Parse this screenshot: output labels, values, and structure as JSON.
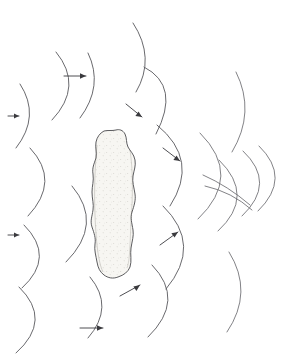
{
  "figure": {
    "title": "",
    "caption": "",
    "background_color": "#ffffff",
    "line_color": "#58585c",
    "arrow_color": "#3a3a3e",
    "obstacle_fill": "#f7f6f2",
    "obstacle_stroke": "#4a4a4d",
    "width_px": 300,
    "height_px": 363
  },
  "obstacle": {
    "name": "stippled-irregular-obstacle",
    "label": "",
    "style": "stipple",
    "center_x": 113,
    "center_y": 205,
    "approx_width_px": 50,
    "approx_height_px": 160
  },
  "incident_waves": {
    "group_label": "",
    "direction": "left-to-right",
    "arc_count": 9,
    "arcs": [
      {
        "id": "arc-tl-1",
        "cx": 60,
        "cy": 86,
        "r": 42,
        "a0": -52,
        "a1": 52
      },
      {
        "id": "arc-tl-2",
        "cx": -4,
        "cy": 115,
        "r": 42,
        "a0": -56,
        "a1": 56
      },
      {
        "id": "arc-tm-1",
        "cx": 100,
        "cy": 48,
        "r": 48,
        "a0": -52,
        "a1": 46
      },
      {
        "id": "arc-ml-1",
        "cx": 9,
        "cy": 181,
        "r": 47,
        "a0": -60,
        "a1": 60
      },
      {
        "id": "arc-ml-2",
        "cx": 11,
        "cy": 257,
        "r": 45,
        "a0": -58,
        "a1": 58
      },
      {
        "id": "arc-bl-1",
        "cx": 4,
        "cy": 320,
        "r": 48,
        "a0": -60,
        "a1": 58
      },
      {
        "id": "arc-bm-1",
        "cx": 66,
        "cy": 306,
        "r": 44,
        "a0": -54,
        "a1": 52
      },
      {
        "id": "arc-bm-2",
        "cx": 55,
        "cy": 227,
        "r": 46,
        "a0": -52,
        "a1": 56
      },
      {
        "id": "arc-tl-3",
        "cx": 86,
        "cy": 147,
        "r": 46,
        "a0": -58,
        "a1": 50
      }
    ]
  },
  "diffracted_waves": {
    "group_label": "",
    "direction": "bending-around-obstacle",
    "arc_count": 10,
    "arcs": [
      {
        "id": "arc-r-1",
        "cx": 133,
        "cy": 112,
        "r": 48,
        "a0": -78,
        "a1": 30
      },
      {
        "id": "arc-r-2",
        "cx": 149,
        "cy": 166,
        "r": 45,
        "a0": -82,
        "a1": 55
      },
      {
        "id": "arc-r-3",
        "cx": 154,
        "cy": 247,
        "r": 46,
        "a0": -60,
        "a1": 78
      },
      {
        "id": "arc-r-4",
        "cx": 135,
        "cy": 300,
        "r": 48,
        "a0": -60,
        "a1": 66
      },
      {
        "id": "arc-r-5",
        "cx": 209,
        "cy": 112,
        "r": 44,
        "a0": -60,
        "a1": 58
      },
      {
        "id": "arc-r-6",
        "cx": 208,
        "cy": 292,
        "r": 44,
        "a0": -62,
        "a1": 58
      },
      {
        "id": "arc-r-7",
        "cx": 193,
        "cy": 176,
        "r": 46,
        "a0": -80,
        "a1": 72
      },
      {
        "id": "arc-r-8",
        "cx": 218,
        "cy": 195,
        "r": 36,
        "a0": -88,
        "a1": 84
      },
      {
        "id": "arc-r-9",
        "cx": 241,
        "cy": 183,
        "r": 34,
        "a0": -86,
        "a1": 80
      },
      {
        "id": "arc-r-10",
        "cx": 257,
        "cy": 178,
        "r": 33,
        "a0": -84,
        "a1": 82
      }
    ]
  },
  "direction_arrows": {
    "group_label": "",
    "count": 8,
    "items": [
      {
        "id": "arrow-top-left",
        "x": 68,
        "y": 76,
        "angle_deg": 0,
        "length": 26,
        "label": ""
      },
      {
        "id": "arrow-mid-left-1",
        "x": 12,
        "y": 116,
        "angle_deg": 0,
        "length": 12,
        "label": ""
      },
      {
        "id": "arrow-mid-left-2",
        "x": 12,
        "y": 235,
        "angle_deg": 0,
        "length": 12,
        "label": ""
      },
      {
        "id": "arrow-bottom-left",
        "x": 82,
        "y": 328,
        "angle_deg": 0,
        "length": 26,
        "label": ""
      },
      {
        "id": "arrow-upper-bend",
        "x": 128,
        "y": 110,
        "angle_deg": 38,
        "length": 20,
        "label": ""
      },
      {
        "id": "arrow-right-bend",
        "x": 166,
        "y": 152,
        "angle_deg": 36,
        "length": 20,
        "label": ""
      },
      {
        "id": "arrow-lower-bend",
        "x": 166,
        "y": 239,
        "angle_deg": -36,
        "length": 20,
        "label": ""
      },
      {
        "id": "arrow-bottom-bend",
        "x": 125,
        "y": 292,
        "angle_deg": -32,
        "length": 20,
        "label": ""
      }
    ]
  }
}
